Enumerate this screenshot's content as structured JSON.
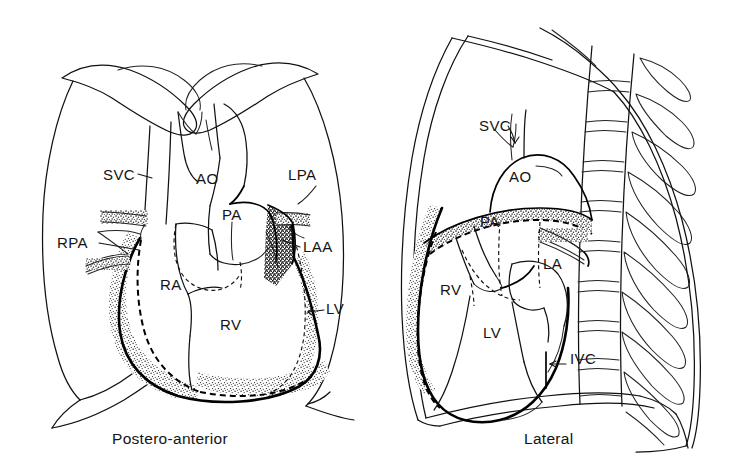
{
  "figure": {
    "title_visible": false,
    "background_color": "#ffffff",
    "ink_color": "#111111",
    "panels": [
      {
        "id": "pa",
        "caption": "Postero-anterior",
        "caption_x": 112,
        "caption_y": 444,
        "labels": [
          {
            "key": "svc",
            "text": "SVC",
            "x": 103,
            "y": 180,
            "anchor": "start"
          },
          {
            "key": "ao",
            "text": "AO",
            "x": 196,
            "y": 184,
            "anchor": "start"
          },
          {
            "key": "lpa",
            "text": "LPA",
            "x": 288,
            "y": 180,
            "anchor": "start"
          },
          {
            "key": "rpa",
            "text": "RPA",
            "x": 57,
            "y": 248,
            "anchor": "start"
          },
          {
            "key": "pa",
            "text": "PA",
            "x": 222,
            "y": 220,
            "anchor": "start"
          },
          {
            "key": "laa",
            "text": "LAA",
            "x": 303,
            "y": 252,
            "anchor": "start"
          },
          {
            "key": "ra",
            "text": "RA",
            "x": 160,
            "y": 290,
            "anchor": "start"
          },
          {
            "key": "lv",
            "text": "LV",
            "x": 326,
            "y": 314,
            "anchor": "start"
          },
          {
            "key": "rv",
            "text": "RV",
            "x": 220,
            "y": 330,
            "anchor": "start"
          }
        ]
      },
      {
        "id": "lateral",
        "caption": "Lateral",
        "caption_x": 524,
        "caption_y": 444,
        "labels": [
          {
            "key": "svc",
            "text": "SVC",
            "x": 479,
            "y": 131,
            "anchor": "start"
          },
          {
            "key": "ao",
            "text": "AO",
            "x": 509,
            "y": 182,
            "anchor": "start"
          },
          {
            "key": "pa",
            "text": "PA",
            "x": 480,
            "y": 227,
            "anchor": "start"
          },
          {
            "key": "la",
            "text": "LA",
            "x": 543,
            "y": 269,
            "anchor": "start"
          },
          {
            "key": "rv",
            "text": "RV",
            "x": 440,
            "y": 295,
            "anchor": "start"
          },
          {
            "key": "lv",
            "text": "LV",
            "x": 483,
            "y": 338,
            "anchor": "start"
          },
          {
            "key": "ivc",
            "text": "IVC",
            "x": 570,
            "y": 364,
            "anchor": "start"
          }
        ]
      }
    ],
    "legend_keys": {
      "SVC": "superior vena cava",
      "IVC": "inferior vena cava",
      "AO": "aorta",
      "PA": "pulmonary artery",
      "RPA": "right pulmonary artery",
      "LPA": "left pulmonary artery",
      "RA": "right atrium",
      "RV": "right ventricle",
      "LA": "left atrium",
      "LAA": "left atrial appendage",
      "LV": "left ventricle"
    }
  }
}
